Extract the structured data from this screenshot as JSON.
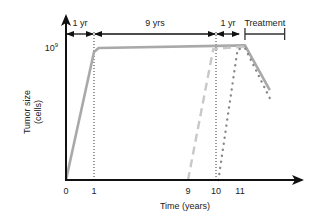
{
  "chart_data": {
    "type": "line",
    "title": "",
    "xlabel": "Time (years)",
    "ylabel": "Tumor size",
    "ylabel_sub": "(cells)",
    "x_ticks": [
      "0",
      "1",
      "9",
      "10",
      "11"
    ],
    "x_tick_values": [
      0,
      1,
      9,
      10,
      11
    ],
    "y_ticks": [
      {
        "label": "10",
        "sup": "9",
        "value": 1000000000
      }
    ],
    "xlim": [
      0,
      13.5
    ],
    "ylim_fraction": [
      0,
      1
    ],
    "grid": false,
    "legend": null,
    "vertical_reference_lines": [
      1,
      10
    ],
    "series": [
      {
        "name": "solid",
        "style": "solid",
        "color": "#a9a9a9",
        "points": [
          [
            0,
            0
          ],
          [
            1,
            0.97
          ],
          [
            1.4,
            1.0
          ],
          [
            11.2,
            1.02
          ],
          [
            12.2,
            0.68
          ]
        ]
      },
      {
        "name": "dashed",
        "style": "dashed",
        "color": "#c8c8c8",
        "points": [
          [
            9,
            0
          ],
          [
            9.9,
            0.99
          ],
          [
            10.4,
            1.0
          ],
          [
            11.2,
            1.01
          ]
        ]
      },
      {
        "name": "dotted",
        "style": "dotted",
        "color": "#888888",
        "points": [
          [
            10.1,
            0
          ],
          [
            10.9,
            0.99
          ],
          [
            11.2,
            1.0
          ],
          [
            12.2,
            0.62
          ]
        ]
      }
    ],
    "annotations": [
      {
        "text": "1 yr",
        "from": 0,
        "to": 1,
        "type": "double-arrow"
      },
      {
        "text": "9 yrs",
        "from": 1,
        "to": 10,
        "type": "double-arrow"
      },
      {
        "text": "1 yr",
        "from": 10,
        "to": 11,
        "type": "double-arrow"
      },
      {
        "text": "Treatment",
        "from": 11.2,
        "to": 12.8,
        "type": "bar"
      }
    ]
  }
}
